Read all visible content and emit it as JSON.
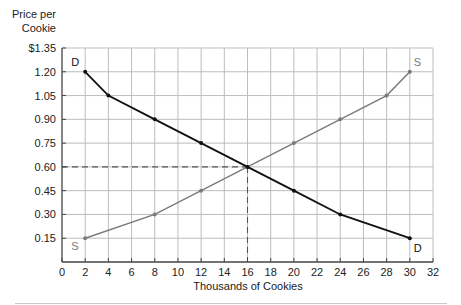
{
  "chart_data": {
    "type": "line",
    "title": "",
    "xlabel": "Thousands of Cookies",
    "ylabel": "Price per Cookie",
    "xlim": [
      0,
      32
    ],
    "ylim": [
      0,
      1.35
    ],
    "grid": true,
    "x_ticks": [
      "0",
      "2",
      "4",
      "6",
      "8",
      "10",
      "12",
      "14",
      "16",
      "18",
      "20",
      "22",
      "24",
      "26",
      "28",
      "30",
      "32"
    ],
    "y_ticks": [
      "$1.35",
      "1.20",
      "1.05",
      "0.90",
      "0.75",
      "0.60",
      "0.45",
      "0.30",
      "0.15"
    ],
    "series": [
      {
        "name": "D",
        "label": "Demand",
        "color": "#111111",
        "points": [
          [
            2,
            1.2
          ],
          [
            4,
            1.05
          ],
          [
            8,
            0.9
          ],
          [
            12,
            0.75
          ],
          [
            16,
            0.6
          ],
          [
            20,
            0.45
          ],
          [
            24,
            0.3
          ],
          [
            30,
            0.15
          ]
        ]
      },
      {
        "name": "S",
        "label": "Supply",
        "color": "#7a7a7a",
        "points": [
          [
            2,
            0.15
          ],
          [
            8,
            0.3
          ],
          [
            12,
            0.45
          ],
          [
            16,
            0.6
          ],
          [
            20,
            0.75
          ],
          [
            24,
            0.9
          ],
          [
            28,
            1.05
          ],
          [
            30,
            1.2
          ]
        ]
      }
    ],
    "annotations": {
      "equilibrium": {
        "x": 16,
        "y": 0.6,
        "dashed_guides": true
      },
      "curve_labels": [
        {
          "text": "D",
          "x": 2,
          "y": 1.2,
          "position": "upper-left"
        },
        {
          "text": "D",
          "x": 30,
          "y": 0.15,
          "position": "lower-right"
        },
        {
          "text": "S",
          "x": 2,
          "y": 0.15,
          "position": "lower-left"
        },
        {
          "text": "S",
          "x": 30,
          "y": 1.2,
          "position": "upper-right"
        }
      ]
    }
  },
  "axis": {
    "y_title_line1": "Price per",
    "y_title_line2": "Cookie",
    "x_title": "Thousands of Cookies"
  },
  "colors": {
    "demand": "#111111",
    "supply": "#7a7a7a",
    "grid": "#bdbdbd",
    "axis": "#444444",
    "guide": "#555555"
  }
}
